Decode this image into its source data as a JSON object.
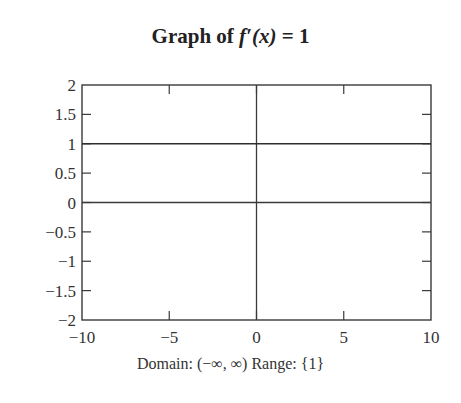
{
  "title": {
    "prefix": "Graph of ",
    "function": "f′(x)",
    "suffix": " = 1"
  },
  "caption": "Domain: (−∞, ∞)  Range: {1}",
  "chart_data": {
    "type": "line",
    "title": "Graph of f′(x) = 1",
    "xlabel": "",
    "ylabel": "",
    "xlim": [
      -10,
      10
    ],
    "ylim": [
      -2,
      2
    ],
    "x_ticks": [
      -10,
      -5,
      0,
      5,
      10
    ],
    "x_tick_labels": [
      "−10",
      "−5",
      "0",
      "5",
      "10"
    ],
    "y_ticks": [
      2,
      1.5,
      1,
      0.5,
      0,
      -0.5,
      -1,
      -1.5,
      -2
    ],
    "y_tick_labels": [
      "2",
      "1.5",
      "1",
      "0.5",
      "0",
      "−0.5",
      "−1",
      "−1.5",
      "−2"
    ],
    "grid": false,
    "axes_lines": {
      "x_axis_at_y": 0,
      "y_axis_at_x": 0
    },
    "series": [
      {
        "name": "f′(x) = 1",
        "x": [
          -10,
          10
        ],
        "y": [
          1,
          1
        ]
      }
    ],
    "annotations": [
      "Domain: (−∞, ∞)  Range: {1}"
    ]
  }
}
